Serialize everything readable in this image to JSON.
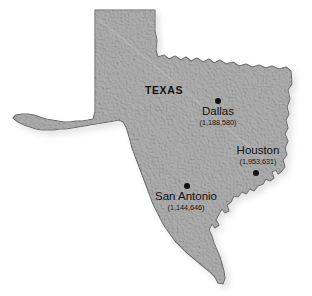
{
  "figure": {
    "type": "thematic-map",
    "subject": "Texas",
    "width": 312,
    "height": 296,
    "background_color": "#ffffff"
  },
  "map": {
    "state_label": "TEXAS",
    "fill_color": "#a9a9a9",
    "outline_color": "#5f5f5f",
    "shadow_color": "#b8b8b8"
  },
  "cities": [
    {
      "name": "Dallas",
      "population_label": "(1,188,580)",
      "population": 1188580,
      "dot_x": 218,
      "dot_y": 101,
      "label_x": 218,
      "label_y": 108
    },
    {
      "name": "Houston",
      "population_label": "(1,953,631)",
      "population": 1953631,
      "dot_x": 256,
      "dot_y": 173,
      "label_x": 258,
      "label_y": 147
    },
    {
      "name": "San Antonio",
      "population_label": "(1,144,646)",
      "population": 1144646,
      "dot_x": 187,
      "dot_y": 186,
      "label_x": 186,
      "label_y": 193
    }
  ]
}
